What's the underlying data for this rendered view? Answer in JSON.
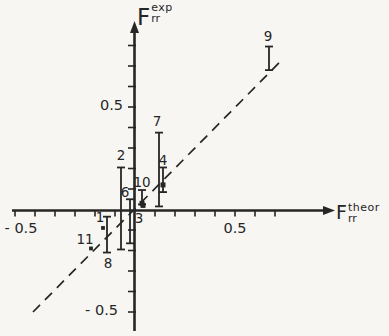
{
  "figure": {
    "background": "#f7f6f3",
    "ink": "#262626"
  },
  "chart_data": {
    "type": "scatter",
    "title": "",
    "xlabel": {
      "base": "F",
      "sub": "rr",
      "sup": "theor"
    },
    "ylabel": {
      "base": "F",
      "sub": "rr",
      "sup": "exp"
    },
    "xlim": [
      -0.62,
      1.0
    ],
    "ylim": [
      -0.6,
      0.93
    ],
    "grid": false,
    "legend": null,
    "reference_line": {
      "style": "dashed",
      "equation": "y = x",
      "x1": -0.51,
      "y1": -0.5,
      "x2": 0.735,
      "y2": 0.73
    },
    "x_ticks": [
      -0.6,
      -0.5,
      -0.4,
      -0.3,
      -0.2,
      -0.1,
      0.1,
      0.2,
      0.3,
      0.4,
      0.5,
      0.6,
      0.7
    ],
    "y_ticks": [
      -0.5,
      -0.4,
      -0.3,
      -0.2,
      -0.1,
      0.1,
      0.2,
      0.3,
      0.4,
      0.5,
      0.6,
      0.7,
      0.8
    ],
    "x_tick_labels": [
      {
        "value": -0.5,
        "text": "- 0.5",
        "dx": -14,
        "dy": 13
      },
      {
        "value": 0.5,
        "text": "0.5",
        "dx": 0,
        "dy": 13
      }
    ],
    "y_tick_labels": [
      {
        "value": 0.5,
        "text": "0.5",
        "dx": 0,
        "dy": -2
      },
      {
        "value": -0.5,
        "text": "- 0.5",
        "dx": -5,
        "dy": -2
      }
    ],
    "points": [
      {
        "label": "1",
        "x": -0.16,
        "y": -0.09,
        "y_min": null,
        "y_max": null,
        "marker": "dot",
        "label_anchor": "marker",
        "label_dx": -3,
        "label_dy": -10
      },
      {
        "label": "2",
        "x": -0.07,
        "y": null,
        "y_min": -0.195,
        "y_max": 0.205,
        "marker": "none",
        "label_anchor": "top",
        "label_dx": 0,
        "label_dy": -12
      },
      {
        "label": "3",
        "x": 0.04,
        "y": 0.02,
        "y_min": null,
        "y_max": null,
        "marker": "square",
        "label_anchor": "marker",
        "label_dx": -4,
        "label_dy": 13
      },
      {
        "label": "4",
        "x": 0.14,
        "y": 0.12,
        "y_min": 0.085,
        "y_max": 0.205,
        "marker": "square",
        "label_anchor": "top",
        "label_dx": 0,
        "label_dy": -7
      },
      {
        "label": "6",
        "x": -0.025,
        "y": null,
        "y_min": -0.165,
        "y_max": 0.05,
        "marker": "none",
        "label_anchor": "top",
        "label_dx": -5,
        "label_dy": -7
      },
      {
        "label": "7",
        "x": 0.12,
        "y": null,
        "y_min": 0.015,
        "y_max": 0.375,
        "marker": "none",
        "label_anchor": "top",
        "label_dx": -2,
        "label_dy": -11
      },
      {
        "label": "8",
        "x": -0.14,
        "y": null,
        "y_min": -0.21,
        "y_max": -0.035,
        "marker": "none",
        "label_anchor": "bottom",
        "label_dx": 1,
        "label_dy": 11
      },
      {
        "label": "9",
        "x": 0.67,
        "y": null,
        "y_min": 0.68,
        "y_max": 0.795,
        "marker": "none",
        "label_anchor": "top",
        "label_dx": -1,
        "label_dy": -10
      },
      {
        "label": "10",
        "x": 0.035,
        "y": 0.03,
        "y_min": 0.025,
        "y_max": 0.095,
        "marker": "square",
        "label_anchor": "top",
        "label_dx": 0,
        "label_dy": -8
      },
      {
        "label": "11",
        "x": -0.22,
        "y": -0.19,
        "y_min": null,
        "y_max": null,
        "marker": "dot",
        "label_anchor": "marker",
        "label_dx": -6,
        "label_dy": -9
      }
    ]
  }
}
